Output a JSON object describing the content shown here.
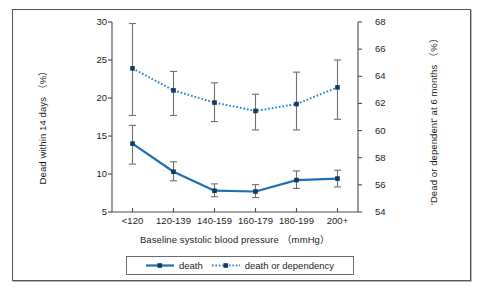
{
  "figure": {
    "background_color": "#ffffff",
    "frame_color": "#55555c"
  },
  "chart_data": {
    "type": "line",
    "title": "",
    "subtitle": "",
    "xlabel": "Baseline systolic blood pressure （mmHg）",
    "categories": [
      "<120",
      "120-139",
      "140-159",
      "160-179",
      "180-199",
      "200+"
    ],
    "grid": false,
    "legend_position": "bottom",
    "axes": {
      "left": {
        "label": "Dead within 14 days （%）",
        "ticks": [
          "5",
          "10",
          "15",
          "20",
          "25",
          "30"
        ],
        "tick_values": [
          5,
          10,
          15,
          20,
          25,
          30
        ],
        "ylim": [
          5,
          30
        ],
        "color": "#4a4a4f"
      },
      "right": {
        "label": "'Dead or dependent' at 6 months （%）",
        "ticks": [
          "54",
          "56",
          "58",
          "60",
          "62",
          "64",
          "66",
          "68"
        ],
        "tick_values": [
          54,
          56,
          58,
          60,
          62,
          64,
          66,
          68
        ],
        "ylim": [
          54,
          68
        ],
        "color": "#4a4a4f"
      }
    },
    "series": [
      {
        "name": "death",
        "legend_label": "death",
        "axis": "left",
        "style": "solid",
        "color": "#1f6fb5",
        "marker": "square",
        "marker_color": "#123a63",
        "values": [
          14.0,
          10.3,
          7.8,
          7.7,
          9.2,
          9.4
        ],
        "ci_lower": [
          11.3,
          9.1,
          7.0,
          6.9,
          8.1,
          8.3
        ],
        "ci_upper": [
          16.4,
          11.6,
          8.7,
          8.6,
          10.4,
          10.5
        ]
      },
      {
        "name": "death or dependency",
        "legend_label": "death or dependency",
        "axis": "right",
        "style": "dotted",
        "color": "#2f86cc",
        "marker": "square",
        "marker_color": "#123a63",
        "values": [
          64.4,
          62.9,
          61.9,
          61.4,
          61.8,
          62.9
        ],
        "ci_lower": [
          60.9,
          60.9,
          60.3,
          60.0,
          60.0,
          60.5
        ],
        "ci_upper": [
          67.7,
          65.0,
          63.4,
          62.9,
          64.2,
          64.5
        ],
        "values_left_scale": [
          23.9,
          21.0,
          19.4,
          18.3,
          19.2,
          21.4
        ],
        "ci_lower_left_scale": [
          17.7,
          17.7,
          16.9,
          15.8,
          15.8,
          17.2
        ],
        "ci_upper_left_scale": [
          29.8,
          23.5,
          22.0,
          20.5,
          23.4,
          25.0
        ]
      }
    ],
    "error_bar_color": "#6f6f74"
  }
}
